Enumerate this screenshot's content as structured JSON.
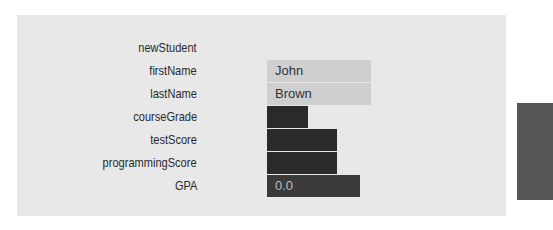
{
  "object_name": "newStudent",
  "fields": [
    {
      "name": "firstName",
      "value": "John",
      "style": "light",
      "width": 104
    },
    {
      "name": "lastName",
      "value": "Brown",
      "style": "light",
      "width": 104
    },
    {
      "name": "courseGrade",
      "value": "",
      "style": "dark",
      "width": 41
    },
    {
      "name": "testScore",
      "value": "",
      "style": "dark",
      "width": 70
    },
    {
      "name": "programmingScore",
      "value": "",
      "style": "dark",
      "width": 70
    },
    {
      "name": "GPA",
      "value": "0.0",
      "style": "dark2",
      "width": 93
    }
  ]
}
